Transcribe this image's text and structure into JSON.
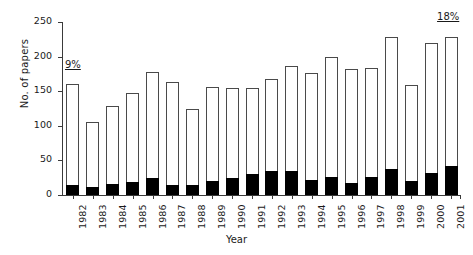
{
  "chart_data": {
    "type": "bar",
    "title": "",
    "xlabel": "Year",
    "ylabel": "No. of papers",
    "ylim": [
      0,
      250
    ],
    "yticks": [
      0,
      50,
      100,
      150,
      200,
      250
    ],
    "grid": false,
    "legend": "none",
    "stacked": true,
    "categories": [
      "1982",
      "1983",
      "1984",
      "1985",
      "1986",
      "1987",
      "1988",
      "1989",
      "1990",
      "1991",
      "1992",
      "1993",
      "1994",
      "1995",
      "1996",
      "1997",
      "1998",
      "1999",
      "2000",
      "2001"
    ],
    "series": [
      {
        "name": "Subset (filled black)",
        "color": "#000000",
        "values": [
          15,
          11,
          16,
          19,
          25,
          15,
          14,
          20,
          25,
          31,
          35,
          34,
          22,
          26,
          18,
          26,
          37,
          20,
          32,
          42
        ]
      },
      {
        "name": "Remainder (white)",
        "color": "#ffffff",
        "values": [
          145,
          94,
          112,
          128,
          153,
          149,
          110,
          136,
          129,
          124,
          132,
          152,
          155,
          174,
          164,
          158,
          191,
          139,
          188,
          187
        ]
      }
    ],
    "totals": [
      160,
      105,
      128,
      147,
      178,
      164,
      124,
      156,
      154,
      155,
      167,
      186,
      177,
      200,
      182,
      184,
      228,
      159,
      220,
      229
    ],
    "annotations": [
      {
        "text": "9%",
        "category": "1982",
        "position": "above-left"
      },
      {
        "text": "18%",
        "category": "2001",
        "position": "above-right"
      }
    ]
  }
}
